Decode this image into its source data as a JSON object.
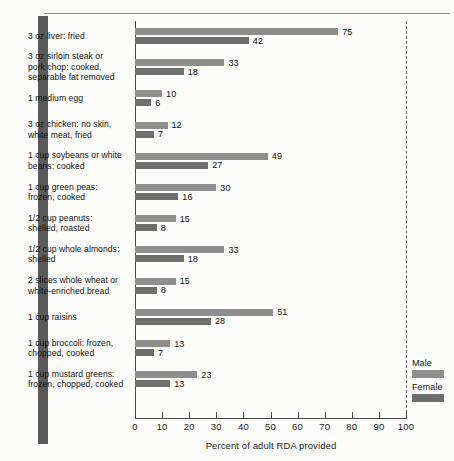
{
  "chart_data": {
    "type": "bar",
    "orientation": "horizontal",
    "title": "",
    "xlabel": "Percent of adult RDA provided",
    "ylabel": "",
    "xlim": [
      0,
      100
    ],
    "xticks": [
      0,
      10,
      20,
      30,
      40,
      50,
      60,
      70,
      80,
      90,
      100
    ],
    "xtick_labels": [
      "0",
      "10",
      "20",
      "30",
      "40",
      "50",
      "60",
      "70",
      "80",
      "90",
      "100"
    ],
    "grid": false,
    "reference_line": {
      "value": 100,
      "style": "dashed"
    },
    "legend_position": "right",
    "categories": [
      "3 oz liver:  fried",
      "3 oz sirloin steak or pork chop:  cooked, separable fat removed",
      "1 medium egg",
      "3 oz chicken:  no skin, white meat, fried",
      "1 cup soybeans or white beans:  cooked",
      "1 cup green peas: frozen, cooked",
      "1/2 cup peanuts: shelled, roasted",
      "1/2 cup whole almonds: shelled",
      "2 slices whole wheat or white-enriched bread",
      "1 cup raisins",
      "1 cup broccoli:  frozen, chopped, cooked",
      "1 cup mustard greens: frozen, chopped, cooked"
    ],
    "series": [
      {
        "name": "Male",
        "color": "#8e8e8e",
        "values": [
          75,
          33,
          10,
          12,
          49,
          30,
          15,
          33,
          15,
          51,
          13,
          23
        ]
      },
      {
        "name": "Female",
        "color": "#6e6e6e",
        "values": [
          42,
          18,
          6,
          7,
          27,
          16,
          8,
          18,
          8,
          28,
          7,
          13
        ]
      }
    ]
  },
  "rows": [
    {
      "label_lines": [
        "3 oz liver:  fried"
      ],
      "male": 75,
      "female": 42
    },
    {
      "label_lines": [
        "3 oz sirloin steak or",
        "pork chop:  cooked,",
        "separable fat removed"
      ],
      "male": 33,
      "female": 18
    },
    {
      "label_lines": [
        "1 medium egg"
      ],
      "male": 10,
      "female": 6
    },
    {
      "label_lines": [
        "3 oz chicken:  no skin,",
        "white meat, fried"
      ],
      "male": 12,
      "female": 7
    },
    {
      "label_lines": [
        "1 cup soybeans or white",
        "beans:  cooked"
      ],
      "male": 49,
      "female": 27
    },
    {
      "label_lines": [
        "1 cup green peas:",
        "frozen, cooked"
      ],
      "male": 30,
      "female": 16
    },
    {
      "label_lines": [
        "1/2 cup peanuts:",
        "shelled, roasted"
      ],
      "male": 15,
      "female": 8
    },
    {
      "label_lines": [
        "1/2 cup whole almonds:",
        "shelled"
      ],
      "male": 33,
      "female": 18
    },
    {
      "label_lines": [
        "2 slices whole wheat or",
        "white-enriched bread"
      ],
      "male": 15,
      "female": 8
    },
    {
      "label_lines": [
        "1 cup raisins"
      ],
      "male": 51,
      "female": 28
    },
    {
      "label_lines": [
        "1 cup broccoli:  frozen,",
        "chopped, cooked"
      ],
      "male": 13,
      "female": 7
    },
    {
      "label_lines": [
        "1 cup mustard greens:",
        "frozen, chopped, cooked"
      ],
      "male": 23,
      "female": 13
    }
  ],
  "axis": {
    "x_title": "Percent of adult RDA provided",
    "ticks": [
      "0",
      "10",
      "20",
      "30",
      "40",
      "50",
      "60",
      "70",
      "80",
      "90",
      "100"
    ]
  },
  "legend": {
    "entries": [
      {
        "label": "Male",
        "color": "#8e8e8e"
      },
      {
        "label": "Female",
        "color": "#6e6e6e"
      }
    ]
  },
  "colors": {
    "male_bar": "#8e8e8e",
    "female_bar": "#6e6e6e",
    "axis": "#4a4a4a",
    "text": "#141414",
    "background": "#fcfcfa",
    "scan_edge": "#5a5a5a"
  }
}
